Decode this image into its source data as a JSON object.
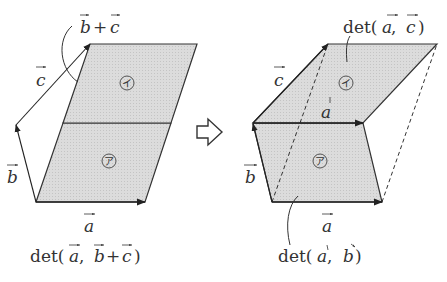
{
  "colors": {
    "fill": "#d9d9d9",
    "stroke": "#333333",
    "text": "#333333"
  },
  "left_figure": {
    "label_b_plus_c": {
      "b": "b",
      "plus": "+",
      "c": "c"
    },
    "label_c": "c",
    "label_b": "b",
    "label_a": "a",
    "region_upper": "イ",
    "region_lower": "ア",
    "caption": {
      "prefix": "det(",
      "a": "a",
      "comma": " ,",
      "b": "b",
      "plus": "+",
      "c": "c",
      "suffix": ")"
    }
  },
  "transition_arrow": "⇨",
  "right_figure": {
    "label_c": "c",
    "label_b": "b",
    "label_a_mid": "a",
    "label_a_bottom": "a",
    "region_upper": "イ",
    "region_lower": "ア",
    "caption_top": {
      "prefix": "det(",
      "a": "a",
      "comma": " ,",
      "c": "c",
      "suffix": ")"
    },
    "caption_bottom": {
      "prefix": "det(",
      "a": "a",
      "comma": " ,",
      "b": "b",
      "suffix": ")"
    }
  }
}
